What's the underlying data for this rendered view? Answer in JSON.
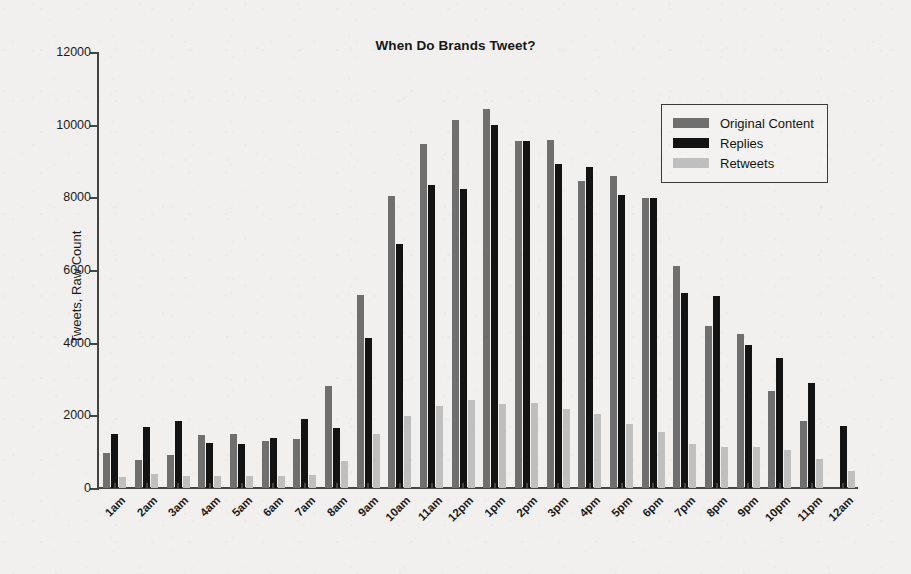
{
  "chart_data": {
    "type": "bar",
    "title": "When Do Brands Tweet?",
    "xlabel": "",
    "ylabel": "Tweets, Raw Count",
    "ylim": [
      0,
      12000
    ],
    "yticks": [
      0,
      2000,
      4000,
      6000,
      8000,
      10000,
      12000
    ],
    "ytick_labels": [
      "0",
      "2000",
      "4000",
      "6000",
      "8000",
      "10000",
      "12000"
    ],
    "grid": false,
    "legend_position": "upper right",
    "categories": [
      "1am",
      "2am",
      "3am",
      "4am",
      "5am",
      "6am",
      "7am",
      "8am",
      "9am",
      "10am",
      "11am",
      "12pm",
      "1pm",
      "2pm",
      "3pm",
      "4pm",
      "5pm",
      "6pm",
      "7pm",
      "8pm",
      "9pm",
      "10pm",
      "11pm",
      "12am"
    ],
    "series": [
      {
        "name": "Original Content",
        "color": "#6f6f6f",
        "values": [
          950,
          780,
          900,
          1460,
          1480,
          1300,
          1340,
          2800,
          5300,
          8050,
          9480,
          10120,
          10430,
          9560,
          9570,
          8450,
          8590,
          7990,
          6120,
          4450,
          4240,
          2680,
          1850,
          0
        ]
      },
      {
        "name": "Replies",
        "color": "#131313",
        "values": [
          1480,
          1680,
          1840,
          1230,
          1220,
          1390,
          1890,
          1640,
          4140,
          6710,
          8330,
          8220,
          9980,
          9550,
          8910,
          8840,
          8070,
          7990,
          5370,
          5290,
          3930,
          3580,
          2900,
          1710
        ]
      },
      {
        "name": "Retweets",
        "color": "#bfbfbf",
        "values": [
          300,
          390,
          330,
          340,
          340,
          330,
          370,
          740,
          1480,
          1970,
          2250,
          2420,
          2310,
          2340,
          2180,
          2030,
          1770,
          1530,
          1220,
          1120,
          1120,
          1050,
          790,
          480
        ]
      }
    ]
  },
  "legend": {
    "items": [
      {
        "label": "Original Content"
      },
      {
        "label": "Replies"
      },
      {
        "label": "Retweets"
      }
    ]
  }
}
